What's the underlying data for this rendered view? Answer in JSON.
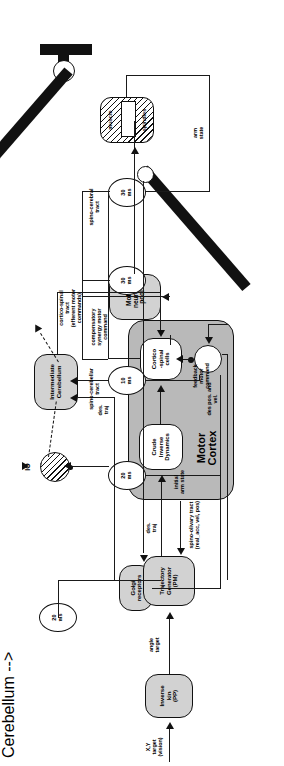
{
  "diagram": {
    "nodes": {
      "golgi": "Golgi\nreceptors",
      "muscle": "muscle",
      "spindles": "spindles",
      "motor_neuron_pool": "Motor\nneuron\npool",
      "io": "IO",
      "cerebellum": "Intermediate\nCerebellum",
      "cortico_spinal_cells": "Cortico\n-spinal\ncells",
      "crude_inverse_dynamics": "Crude\nInverse\nDynamics",
      "motor_cortex": "Motor\nCortex",
      "trajectory_generator": "Trajectory\nGenerator\n(PM)",
      "inverse_kin": "Inverse\nkin\n(PP)",
      "summing_junction": ""
    },
    "delays": {
      "d_spino_olivary": "20\nms",
      "d_spino_cerebellar": "10\nms",
      "d_cortico_spinal": "30\nms",
      "d_spino_cerebral": "30\nms",
      "d_des_traj": "20\nms"
    },
    "edge_labels": {
      "spino_olivary": "spino-olivary tract\n(real_acc, vel, pos)",
      "spino_cerebellar": "spino-cerebellar\ntract",
      "cortico_spinal": "cortico-spinal\ntract\n(efferent motor\ncommands)",
      "spino_cerebral": "spino-cerebral\ntract",
      "compensatory": "compensatory\nsynergy motor\ncommand",
      "feedback_motor_command": "feedback\nmotor\ncommand",
      "des_pos_vel": "des pos. and\nvel.",
      "des_traj_cereb": "des.\ntraj",
      "des_traj_cortex": "des.\ntraj",
      "des_traj_io": "des.\ntraj",
      "arm_state": "arm\nstate",
      "angle_target": "angle\ntarget",
      "initial_arm_state": "initial\narm state",
      "xy_target": "X,Y\ntarget\n(vision)"
    },
    "colors": {
      "node_fill": "#d2d2d2",
      "cortex_fill": "#b9b9b9",
      "line": "#1a1a1a",
      "background": "#ffffff"
    }
  }
}
